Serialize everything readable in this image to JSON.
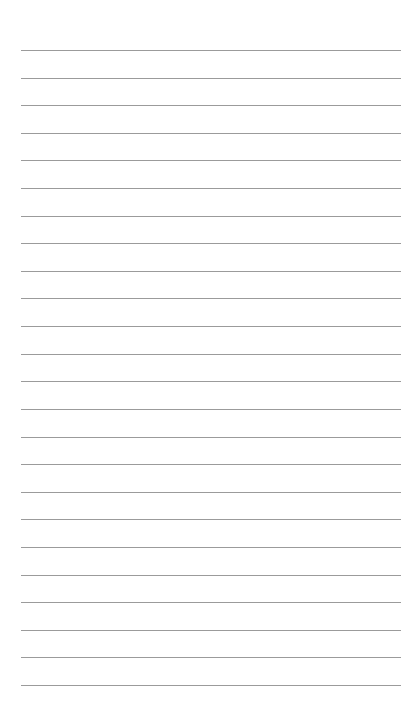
{
  "page": {
    "type": "blank lined paper",
    "background_color": "#ffffff",
    "line_color": "#8a8a8a",
    "line_count": 24,
    "first_line_y": 50,
    "last_line_y": 685,
    "line_left_x": 21,
    "line_right_x": 401
  }
}
